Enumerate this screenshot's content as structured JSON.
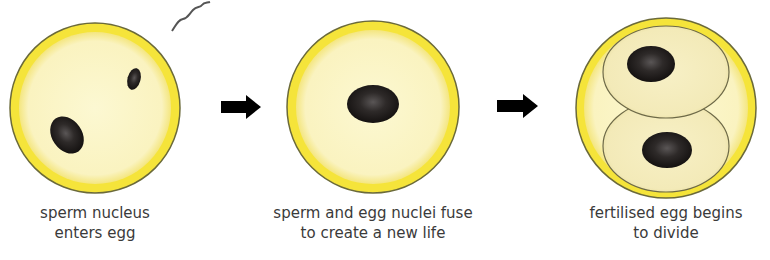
{
  "colors": {
    "membrane": "#f4e23a",
    "outline": "#6b6a3a",
    "cytoplasm": "#fbf6c8",
    "nucleus": "#231f1e",
    "arrow": "#000000",
    "text": "#3a3a3a"
  },
  "stages": [
    {
      "id": "stage-1",
      "label_line1": "sperm nucleus",
      "label_line2": "enters egg"
    },
    {
      "id": "stage-2",
      "label_line1": "sperm and egg nuclei fuse",
      "label_line2": "to create a new life"
    },
    {
      "id": "stage-3",
      "label_line1": "fertilised egg begins",
      "label_line2": "to divide"
    }
  ],
  "arrows": [
    {
      "name": "arrow-right-icon"
    },
    {
      "name": "arrow-right-icon"
    }
  ]
}
